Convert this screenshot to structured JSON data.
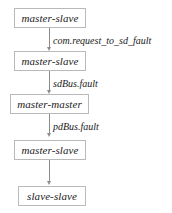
{
  "diagram": {
    "type": "flowchart",
    "orientation": "vertical-top-down",
    "nodes": [
      {
        "id": "n1",
        "label": "master-slave"
      },
      {
        "id": "n2",
        "label": "master-slave"
      },
      {
        "id": "n3",
        "label": "master-master"
      },
      {
        "id": "n4",
        "label": "master-slave"
      },
      {
        "id": "n5",
        "label": "slave-slave"
      }
    ],
    "edges": [
      {
        "from": "n1",
        "to": "n2",
        "label": "com.request_to_sd_fault"
      },
      {
        "from": "n2",
        "to": "n3",
        "label": "sdBus.fault"
      },
      {
        "from": "n3",
        "to": "n4",
        "label": "pdBus.fault"
      },
      {
        "from": "n4",
        "to": "n5",
        "label": ""
      }
    ],
    "colors": {
      "background": "#ffffff",
      "node_border": "#b9b9b9",
      "node_fill": "#ffffff",
      "edge_line": "#8c8c8c",
      "text": "#1a1a1a"
    }
  }
}
